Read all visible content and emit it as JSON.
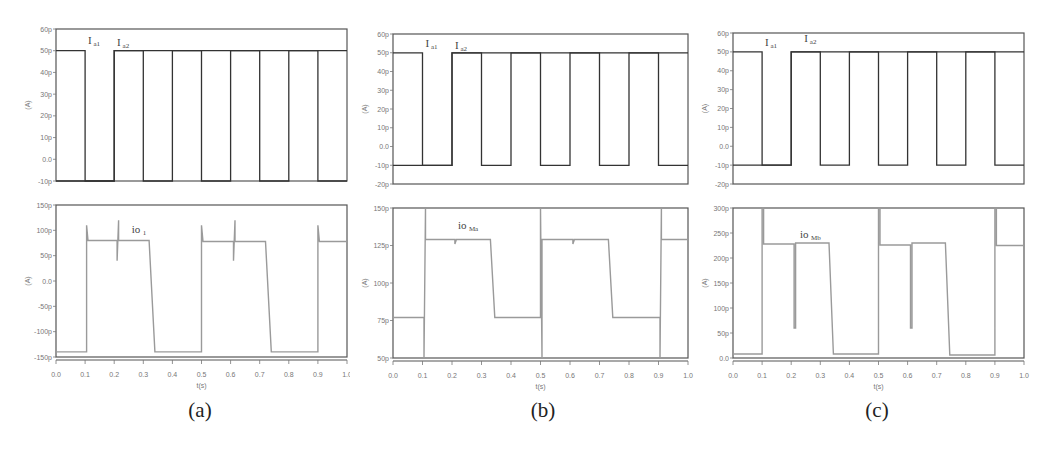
{
  "chart_data": [
    {
      "panel": "a",
      "caption": "(a)",
      "type": "line",
      "xlabel": "t(s)",
      "x_ticks": [
        "0.0",
        "0.1",
        "0.2",
        "0.3",
        "0.4",
        "0.5",
        "0.6",
        "0.7",
        "0.8",
        "0.9",
        "1.0"
      ],
      "xlim": [
        0,
        1
      ],
      "subplots": [
        {
          "ylabel": "(A)",
          "ylim": [
            -10,
            60
          ],
          "y_ticks": [
            "60p",
            "50p",
            "40p",
            "30p",
            "20p",
            "10p",
            "0.0",
            "-10p"
          ],
          "y_tick_values": [
            60,
            50,
            40,
            30,
            20,
            10,
            0,
            -10
          ],
          "series": [
            {
              "name": "Ia1",
              "label_main": "I",
              "label_sub": "a1",
              "label_x": 0.11,
              "label_y": 53,
              "x": [
                0,
                0.1,
                0.1,
                0.2,
                0.2,
                0.4,
                0.4,
                0.5,
                0.5,
                0.6,
                0.6,
                0.8,
                0.8,
                0.9,
                0.9,
                1.0
              ],
              "y": [
                50,
                50,
                -10,
                -10,
                50,
                50,
                50,
                50,
                -10,
                -10,
                50,
                50,
                50,
                50,
                -10,
                -10
              ]
            },
            {
              "name": "Ia2",
              "label_main": "I",
              "label_sub": "a2",
              "label_x": 0.21,
              "label_y": 52,
              "x": [
                0,
                0.2,
                0.2,
                0.3,
                0.3,
                0.4,
                0.4,
                0.6,
                0.6,
                0.7,
                0.7,
                0.8,
                0.8,
                1.0
              ],
              "y": [
                -10,
                -10,
                50,
                50,
                -10,
                -10,
                50,
                50,
                50,
                50,
                -10,
                -10,
                50,
                50
              ]
            }
          ]
        },
        {
          "ylabel": "(A)",
          "ylim": [
            -150,
            150
          ],
          "y_ticks": [
            "150p",
            "100p",
            "50p",
            "0.0",
            "-50p",
            "-100p",
            "-150p"
          ],
          "y_tick_values": [
            150,
            100,
            50,
            0,
            -50,
            -100,
            -150
          ],
          "series": [
            {
              "name": "io1",
              "label_main": "io",
              "label_sub": "1",
              "label_x": 0.26,
              "label_y": 95,
              "x": [
                0,
                0.105,
                0.105,
                0.11,
                0.21,
                0.21,
                0.215,
                0.215,
                0.32,
                0.34,
                0.345,
                0.5,
                0.5,
                0.505,
                0.61,
                0.61,
                0.615,
                0.615,
                0.72,
                0.74,
                0.745,
                0.9,
                0.9,
                0.905,
                1.0
              ],
              "y": [
                -140,
                -140,
                110,
                80,
                80,
                40,
                120,
                80,
                80,
                -140,
                -140,
                -140,
                110,
                78,
                78,
                40,
                120,
                78,
                78,
                -140,
                -140,
                -140,
                110,
                78,
                78
              ]
            }
          ]
        }
      ]
    },
    {
      "panel": "b",
      "caption": "(b)",
      "type": "line",
      "xlabel": "t(s)",
      "x_ticks": [
        "0.0",
        "0.1",
        "0.2",
        "0.3",
        "0.4",
        "0.5",
        "0.6",
        "0.7",
        "0.8",
        "0.9",
        "1.0"
      ],
      "xlim": [
        0,
        1
      ],
      "subplots": [
        {
          "ylabel": "(A)",
          "ylim": [
            -20,
            60
          ],
          "y_ticks": [
            "60p",
            "50p",
            "40p",
            "30p",
            "20p",
            "10p",
            "0.0",
            "-10p",
            "-20p"
          ],
          "y_tick_values": [
            60,
            50,
            40,
            30,
            20,
            10,
            0,
            -10,
            -20
          ],
          "series": [
            {
              "name": "Ia1",
              "label_main": "I",
              "label_sub": "a1",
              "label_x": 0.11,
              "label_y": 53,
              "x": [
                0,
                0.1,
                0.1,
                0.2,
                0.2,
                0.4,
                0.4,
                0.5,
                0.5,
                0.6,
                0.6,
                0.8,
                0.8,
                0.9,
                0.9,
                1.0
              ],
              "y": [
                50,
                50,
                -10,
                -10,
                50,
                50,
                50,
                50,
                -10,
                -10,
                50,
                50,
                50,
                50,
                -10,
                -10
              ]
            },
            {
              "name": "Ia2",
              "label_main": "I",
              "label_sub": "a2",
              "label_x": 0.21,
              "label_y": 52,
              "x": [
                0,
                0.2,
                0.2,
                0.3,
                0.3,
                0.4,
                0.4,
                0.6,
                0.6,
                0.7,
                0.7,
                0.8,
                0.8,
                1.0
              ],
              "y": [
                -10,
                -10,
                50,
                50,
                -10,
                -10,
                50,
                50,
                50,
                50,
                -10,
                -10,
                50,
                50
              ]
            }
          ]
        },
        {
          "ylabel": "(A)",
          "ylim": [
            50,
            150
          ],
          "y_ticks": [
            "150p",
            "125p",
            "100p",
            "75p",
            "50p"
          ],
          "y_tick_values": [
            150,
            125,
            100,
            75,
            50
          ],
          "series": [
            {
              "name": "ioMa",
              "label_main": "io",
              "label_sub": "Ma",
              "label_x": 0.22,
              "label_y": 136,
              "x": [
                0,
                0.105,
                0.105,
                0.11,
                0.11,
                0.21,
                0.21,
                0.215,
                0.33,
                0.345,
                0.5,
                0.5,
                0.505,
                0.505,
                0.61,
                0.61,
                0.615,
                0.73,
                0.745,
                0.905,
                0.905,
                0.91,
                0.91,
                1.0
              ],
              "y": [
                77,
                77,
                50,
                150,
                129,
                129,
                126,
                129,
                129,
                77,
                77,
                150,
                50,
                129,
                129,
                126,
                129,
                129,
                77,
                77,
                50,
                150,
                129,
                129
              ]
            }
          ]
        }
      ]
    },
    {
      "panel": "c",
      "caption": "(c)",
      "type": "line",
      "xlabel": "t(s)",
      "x_ticks": [
        "0.0",
        "0.1",
        "0.2",
        "0.3",
        "0.4",
        "0.5",
        "0.6",
        "0.7",
        "0.8",
        "0.9",
        "1.0"
      ],
      "xlim": [
        0,
        1
      ],
      "subplots": [
        {
          "ylabel": "(A)",
          "ylim": [
            -20,
            60
          ],
          "y_ticks": [
            "60p",
            "50p",
            "40p",
            "30p",
            "20p",
            "10p",
            "0.0",
            "-10p",
            "-20p"
          ],
          "y_tick_values": [
            60,
            50,
            40,
            30,
            20,
            10,
            0,
            -10,
            -20
          ],
          "series": [
            {
              "name": "Ia1",
              "label_main": "I",
              "label_sub": "a1",
              "label_x": 0.11,
              "label_y": 53,
              "x": [
                0,
                0.1,
                0.1,
                0.2,
                0.2,
                0.4,
                0.4,
                0.5,
                0.5,
                0.6,
                0.6,
                0.8,
                0.8,
                0.9,
                0.9,
                1.0
              ],
              "y": [
                50,
                50,
                -10,
                -10,
                50,
                50,
                50,
                50,
                -10,
                -10,
                50,
                50,
                50,
                50,
                -10,
                -10
              ]
            },
            {
              "name": "Ia2",
              "label_main": "I",
              "label_sub": "a2",
              "label_x": 0.245,
              "label_y": 55,
              "x": [
                0,
                0.2,
                0.2,
                0.3,
                0.3,
                0.4,
                0.4,
                0.6,
                0.6,
                0.7,
                0.7,
                0.8,
                0.8,
                1.0
              ],
              "y": [
                -10,
                -10,
                50,
                50,
                -10,
                -10,
                50,
                50,
                50,
                50,
                -10,
                -10,
                50,
                50
              ]
            }
          ]
        },
        {
          "ylabel": "(A)",
          "ylim": [
            0,
            300
          ],
          "y_ticks": [
            "300p",
            "250p",
            "200p",
            "150p",
            "100p",
            "50p",
            "0.0"
          ],
          "y_tick_values": [
            300,
            250,
            200,
            150,
            100,
            50,
            0
          ],
          "series": [
            {
              "name": "ioMb",
              "label_main": "io",
              "label_sub": "Mb",
              "label_x": 0.23,
              "label_y": 240,
              "x": [
                0,
                0.1,
                0.1,
                0.105,
                0.105,
                0.21,
                0.21,
                0.215,
                0.215,
                0.33,
                0.345,
                0.5,
                0.5,
                0.505,
                0.505,
                0.61,
                0.61,
                0.615,
                0.615,
                0.73,
                0.745,
                0.9,
                0.9,
                0.905,
                0.905,
                1.0
              ],
              "y": [
                8,
                8,
                300,
                300,
                228,
                228,
                60,
                60,
                230,
                230,
                8,
                8,
                300,
                300,
                226,
                226,
                60,
                60,
                230,
                230,
                6,
                6,
                300,
                300,
                225,
                225
              ]
            }
          ]
        }
      ]
    }
  ],
  "captions": {
    "a": "(a)",
    "b": "(b)",
    "c": "(c)"
  }
}
